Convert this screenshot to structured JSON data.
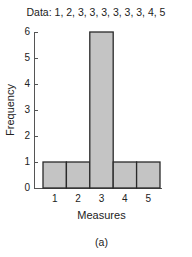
{
  "chart_data": {
    "type": "bar",
    "title": "Data: 1, 2, 3, 3, 3, 3, 3, 3, 4, 5",
    "categories": [
      "1",
      "2",
      "3",
      "4",
      "5"
    ],
    "values": [
      1,
      1,
      6,
      1,
      1
    ],
    "xlabel": "Measures",
    "ylabel": "Frequency",
    "ylim": [
      0,
      6
    ],
    "yticks": [
      "0",
      "1",
      "2",
      "3",
      "4",
      "5",
      "6"
    ],
    "grid": false,
    "legend": null,
    "caption": "(a)",
    "bar_color": "#c4c4c4",
    "edge_color": "#2a2a2a"
  }
}
